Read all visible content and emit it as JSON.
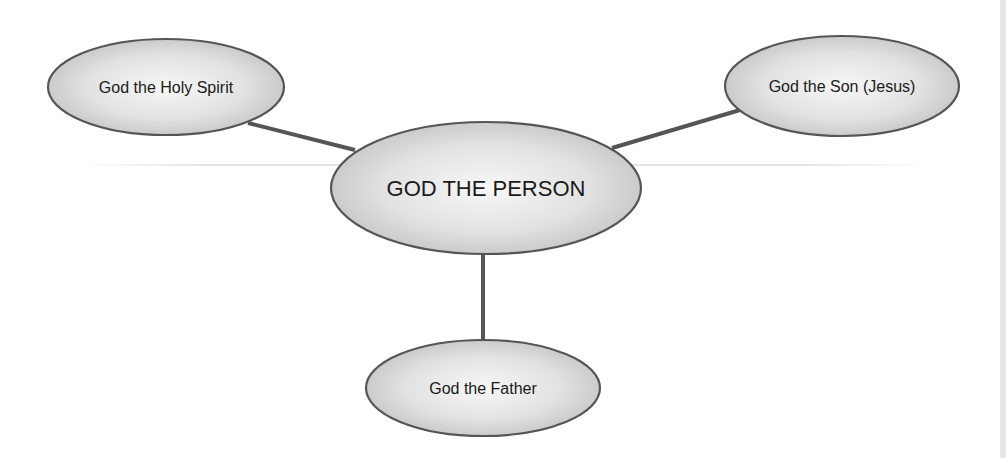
{
  "diagram": {
    "title": "",
    "type": "hub-and-spoke concept map",
    "colors": {
      "node_fill_center": "#f7f7f7",
      "node_fill_edge": "#c4c4c4",
      "node_stroke": "#555555",
      "edge_stroke": "#555555",
      "text": "#1a1a1a",
      "background": "#ffffff"
    },
    "nodes": {
      "center": {
        "label": "GOD THE PERSON",
        "cx": 486,
        "cy": 188,
        "rx": 155,
        "ry": 66,
        "font_size": 22
      },
      "holy_spirit": {
        "label": "God the Holy Spirit",
        "cx": 166,
        "cy": 87,
        "rx": 118,
        "ry": 48,
        "font_size": 16
      },
      "son": {
        "label": "God the Son (Jesus)",
        "cx": 842,
        "cy": 86,
        "rx": 117,
        "ry": 50,
        "font_size": 16
      },
      "father": {
        "label": "God the Father",
        "cx": 483,
        "cy": 388,
        "rx": 117,
        "ry": 48,
        "font_size": 16
      }
    },
    "edges": [
      {
        "from": "center",
        "to": "holy_spirit",
        "x1": 355,
        "y1": 150,
        "x2": 248,
        "y2": 123
      },
      {
        "from": "center",
        "to": "son",
        "x1": 612,
        "y1": 148,
        "x2": 740,
        "y2": 110
      },
      {
        "from": "center",
        "to": "father",
        "x1": 483,
        "y1": 253,
        "x2": 483,
        "y2": 340
      }
    ]
  }
}
